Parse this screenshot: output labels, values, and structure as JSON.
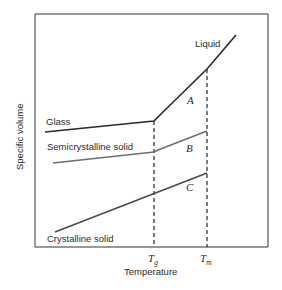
{
  "diagram": {
    "title": "",
    "xlabel": "Temperature",
    "ylabel": "Specific volume",
    "ticks": {
      "tg": {
        "main": "T",
        "sub": "g"
      },
      "tm": {
        "main": "T",
        "sub": "m"
      }
    },
    "curves": {
      "liquid": "Liquid",
      "glass": "Glass",
      "semicrystalline": "Semicrystalline solid",
      "crystalline": "Crystalline solid"
    },
    "regions": {
      "a": "A",
      "b": "B",
      "c": "C"
    },
    "colors": {
      "glass_line": "#2a2a2a",
      "semicrystalline_line": "#6e6e6e",
      "crystalline_line": "#4a4a4a",
      "axes": "#333333"
    }
  }
}
